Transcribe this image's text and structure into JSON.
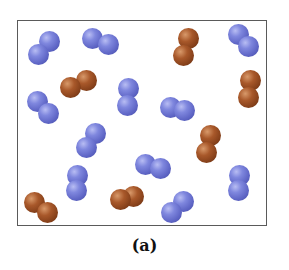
{
  "figure": {
    "caption": "(a)",
    "frame": {
      "left": 17,
      "top": 20,
      "right": 267,
      "bottom": 226,
      "border_color": "#5a5a5a"
    },
    "colors": {
      "blue": "#6c73d2",
      "brown": "#8f4a20"
    },
    "atom_diameter": 21,
    "molecules": [
      {
        "type": "blue",
        "atoms": [
          [
            49,
            41
          ],
          [
            38,
            54
          ]
        ]
      },
      {
        "type": "blue",
        "atoms": [
          [
            92,
            38
          ],
          [
            108,
            44
          ]
        ]
      },
      {
        "type": "brown",
        "atoms": [
          [
            188,
            38
          ],
          [
            183,
            55
          ]
        ]
      },
      {
        "type": "blue",
        "atoms": [
          [
            238,
            34
          ],
          [
            248,
            46
          ]
        ]
      },
      {
        "type": "brown",
        "atoms": [
          [
            70,
            87
          ],
          [
            86,
            80
          ]
        ]
      },
      {
        "type": "blue",
        "atoms": [
          [
            128,
            88
          ],
          [
            127,
            105
          ]
        ]
      },
      {
        "type": "brown",
        "atoms": [
          [
            250,
            80
          ],
          [
            248,
            97
          ]
        ]
      },
      {
        "type": "blue",
        "atoms": [
          [
            37,
            101
          ],
          [
            48,
            113
          ]
        ]
      },
      {
        "type": "blue",
        "atoms": [
          [
            170,
            107
          ],
          [
            184,
            110
          ]
        ]
      },
      {
        "type": "blue",
        "atoms": [
          [
            95,
            133
          ],
          [
            86,
            147
          ]
        ]
      },
      {
        "type": "brown",
        "atoms": [
          [
            210,
            135
          ],
          [
            206,
            152
          ]
        ]
      },
      {
        "type": "blue",
        "atoms": [
          [
            145,
            164
          ],
          [
            160,
            168
          ]
        ]
      },
      {
        "type": "blue",
        "atoms": [
          [
            77,
            175
          ],
          [
            76,
            190
          ]
        ]
      },
      {
        "type": "blue",
        "atoms": [
          [
            239,
            175
          ],
          [
            238,
            190
          ]
        ]
      },
      {
        "type": "brown",
        "atoms": [
          [
            34,
            202
          ],
          [
            47,
            212
          ]
        ]
      },
      {
        "type": "brown",
        "atoms": [
          [
            120,
            199
          ],
          [
            133,
            196
          ]
        ]
      },
      {
        "type": "blue",
        "atoms": [
          [
            183,
            201
          ],
          [
            171,
            212
          ]
        ]
      }
    ],
    "counts": {
      "blue_molecules": 11,
      "brown_molecules": 6
    }
  }
}
